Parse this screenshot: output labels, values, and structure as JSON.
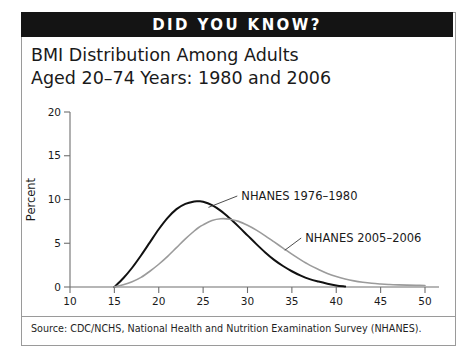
{
  "banner": {
    "label": "DID YOU KNOW?"
  },
  "title": {
    "line1": "BMI Distribution Among Adults",
    "line2": "Aged 20–74 Years: 1980 and 2006"
  },
  "source": {
    "text": "Source: CDC/NCHS, National Health and Nutrition Examination Survey (NHANES)."
  },
  "colors": {
    "banner_background": "#141414",
    "series_1976_1980": "#111111",
    "series_2005_2006": "#9b9b9b",
    "axis": "#6f6f6f",
    "card_border": "#9a9a9a",
    "text": "#1a1a1a"
  },
  "chart_data": {
    "type": "line",
    "title": "BMI Distribution Among Adults Aged 20–74 Years: 1980 and 2006",
    "xlabel": "BMI",
    "ylabel": "Percent",
    "xlim": [
      10,
      50
    ],
    "ylim": [
      0,
      20
    ],
    "xticks": [
      10,
      15,
      20,
      25,
      30,
      35,
      40,
      45,
      50
    ],
    "yticks": [
      0,
      5,
      10,
      15,
      20
    ],
    "xtick_labels": [
      "10",
      "15",
      "20",
      "25",
      "30",
      "35",
      "40",
      "45",
      "50"
    ],
    "ytick_labels": [
      "0",
      "5",
      "10",
      "15",
      "20"
    ],
    "grid": false,
    "legend_position": "inline-annotations",
    "x": [
      15,
      16,
      17,
      18,
      19,
      20,
      21,
      22,
      23,
      24,
      24.5,
      25,
      26,
      27,
      28,
      29,
      30,
      31,
      32,
      33,
      34,
      35,
      36,
      37,
      38,
      39,
      40,
      41,
      42,
      43,
      44,
      45,
      46,
      47,
      48,
      49,
      50
    ],
    "series": [
      {
        "name": "NHANES 1976–1980",
        "color": "#111111",
        "peak_value": 9.8,
        "peak_x": 24.5,
        "values": [
          0.0,
          1.0,
          2.2,
          3.6,
          5.1,
          6.6,
          7.9,
          8.9,
          9.5,
          9.78,
          9.8,
          9.75,
          9.35,
          8.7,
          7.85,
          6.9,
          5.9,
          4.9,
          3.95,
          3.1,
          2.4,
          1.8,
          1.3,
          0.9,
          0.62,
          0.38,
          0.18,
          0.05,
          null,
          null,
          null,
          null,
          null,
          null,
          null,
          null,
          null
        ]
      },
      {
        "name": "NHANES 2005–2006",
        "color": "#9b9b9b",
        "peak_value": 7.8,
        "peak_x": 27.0,
        "values": [
          0.0,
          0.25,
          0.6,
          1.1,
          1.8,
          2.6,
          3.5,
          4.5,
          5.5,
          6.4,
          6.8,
          7.1,
          7.6,
          7.8,
          7.75,
          7.5,
          7.05,
          6.5,
          5.85,
          5.15,
          4.45,
          3.75,
          3.1,
          2.5,
          2.0,
          1.55,
          1.2,
          0.92,
          0.7,
          0.54,
          0.42,
          0.34,
          0.28,
          0.24,
          0.21,
          0.19,
          0.18
        ]
      }
    ],
    "annotations": [
      {
        "text": "NHANES 1976–1980",
        "anchor_x": 25.6,
        "anchor_y": 9.1,
        "label_x": 29.3,
        "label_y": 10.4
      },
      {
        "text": "NHANES 2005–2006",
        "anchor_x": 34.2,
        "anchor_y": 4.2,
        "label_x": 36.5,
        "label_y": 5.6
      }
    ]
  }
}
